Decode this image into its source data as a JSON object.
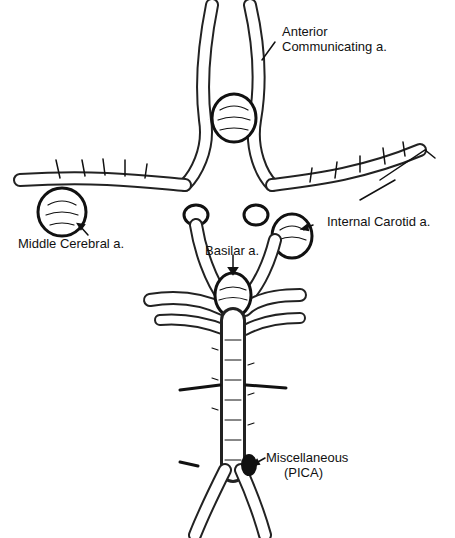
{
  "diagram": {
    "labels": {
      "anterior_line1": "Anterior",
      "anterior_line2": "Communicating a.",
      "middle_cerebral": "Middle Cerebral a.",
      "internal_carotid": "Internal Carotid a.",
      "basilar": "Basilar a.",
      "misc_line1": "Miscellaneous",
      "misc_line2": "(PICA)"
    },
    "colors": {
      "ink": "#111111",
      "background": "#ffffff"
    }
  }
}
